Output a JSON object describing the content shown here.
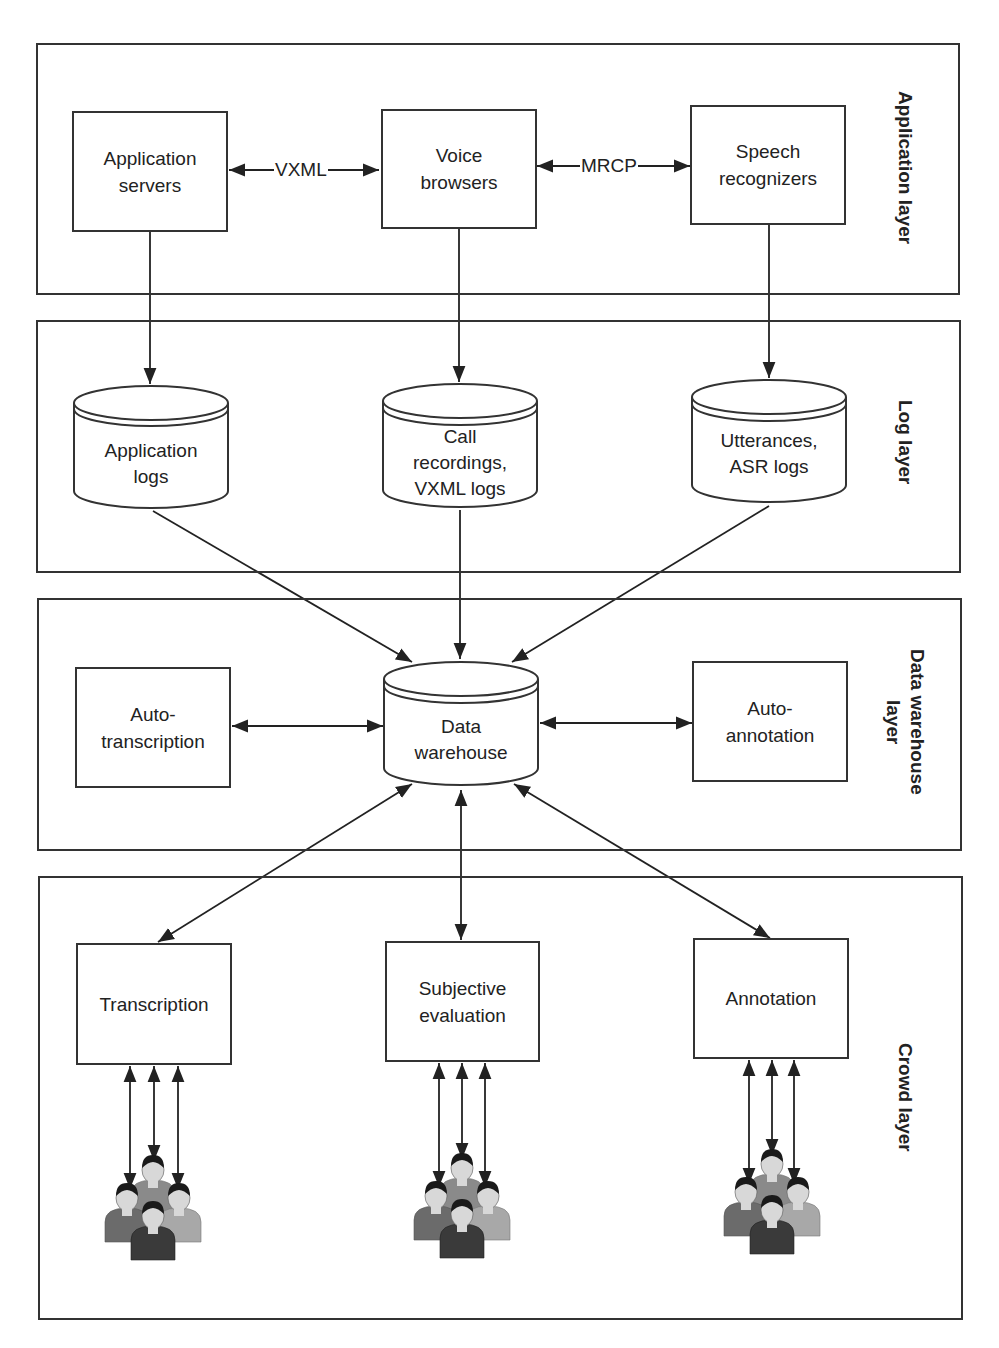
{
  "layers": [
    {
      "id": "application",
      "label": "Application layer"
    },
    {
      "id": "log",
      "label": "Log layer"
    },
    {
      "id": "data_warehouse",
      "label": "Data warehouse\nlayer"
    },
    {
      "id": "crowd",
      "label": "Crowd layer"
    }
  ],
  "nodes": {
    "application_servers": {
      "label": "Application\nservers",
      "shape": "box"
    },
    "voice_browsers": {
      "label": "Voice\nbrowsers",
      "shape": "box"
    },
    "speech_recognizers": {
      "label": "Speech\nrecognizers",
      "shape": "box"
    },
    "application_logs": {
      "label": "Application\nlogs",
      "shape": "cylinder"
    },
    "call_recordings": {
      "label": "Call\nrecordings,\nVXML logs",
      "shape": "cylinder"
    },
    "utterances_asr_logs": {
      "label": "Utterances,\nASR logs",
      "shape": "cylinder"
    },
    "auto_transcription": {
      "label": "Auto-\ntranscription",
      "shape": "box"
    },
    "data_warehouse": {
      "label": "Data\nwarehouse",
      "shape": "cylinder"
    },
    "auto_annotation": {
      "label": "Auto-\nannotation",
      "shape": "box"
    },
    "transcription": {
      "label": "Transcription",
      "shape": "box"
    },
    "subjective_evaluation": {
      "label": "Subjective\nevaluation",
      "shape": "box"
    },
    "annotation": {
      "label": "Annotation",
      "shape": "box"
    }
  },
  "edge_labels": {
    "vxml": "VXML",
    "mrcp": "MRCP"
  },
  "edges": [
    {
      "from": "application_servers",
      "to": "voice_browsers",
      "label": "VXML",
      "bidirectional": true
    },
    {
      "from": "voice_browsers",
      "to": "speech_recognizers",
      "label": "MRCP",
      "bidirectional": true
    },
    {
      "from": "application_servers",
      "to": "application_logs"
    },
    {
      "from": "voice_browsers",
      "to": "call_recordings"
    },
    {
      "from": "speech_recognizers",
      "to": "utterances_asr_logs"
    },
    {
      "from": "application_logs",
      "to": "data_warehouse"
    },
    {
      "from": "call_recordings",
      "to": "data_warehouse"
    },
    {
      "from": "utterances_asr_logs",
      "to": "data_warehouse"
    },
    {
      "from": "auto_transcription",
      "to": "data_warehouse",
      "bidirectional": true
    },
    {
      "from": "data_warehouse",
      "to": "auto_annotation",
      "bidirectional": true
    },
    {
      "from": "data_warehouse",
      "to": "transcription",
      "bidirectional": true
    },
    {
      "from": "data_warehouse",
      "to": "subjective_evaluation",
      "bidirectional": true
    },
    {
      "from": "data_warehouse",
      "to": "annotation",
      "bidirectional": true
    },
    {
      "from": "transcription",
      "to": "crowd_workers",
      "bidirectional": true,
      "count": 3
    },
    {
      "from": "subjective_evaluation",
      "to": "crowd_workers",
      "bidirectional": true,
      "count": 3
    },
    {
      "from": "annotation",
      "to": "crowd_workers",
      "bidirectional": true,
      "count": 3
    }
  ],
  "icons": {
    "crowd": "people-group-icon"
  }
}
